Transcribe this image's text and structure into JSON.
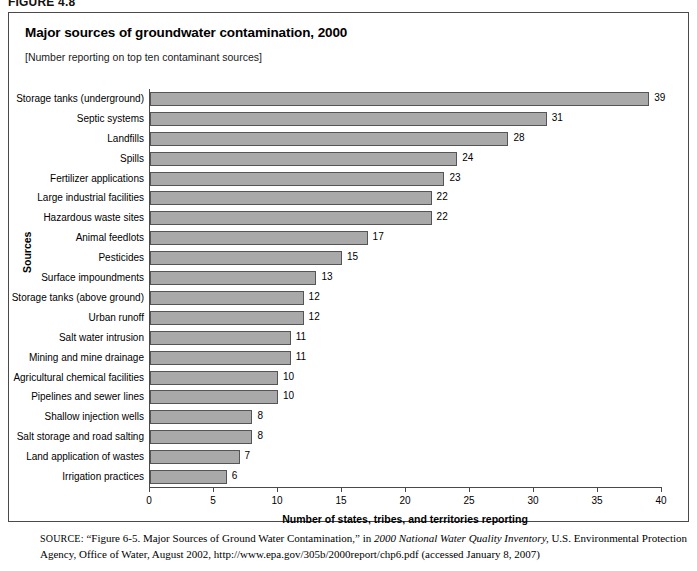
{
  "figure": {
    "number": "FIGURE 4.8"
  },
  "chart": {
    "title": "Major sources of groundwater contamination, 2000",
    "subtitle": "[Number reporting on top ten contaminant sources]"
  },
  "source": {
    "label": "SOURCE:",
    "part1": "“Figure 6-5. Major Sources of Ground Water Contamination,” in ",
    "italic1": "2000 National Water Quality Inventory,",
    "part2": " U.S. Environmental Protection Agency, Office of Water, August 2002, http://www.epa.gov/305b/2000report/chp6.pdf (accessed January 8, 2007)"
  },
  "chart_data": {
    "type": "bar",
    "orientation": "horizontal",
    "title": "Major sources of groundwater contamination, 2000",
    "subtitle": "[Number reporting on top ten contaminant sources]",
    "xlabel": "Number of states, tribes, and territories reporting",
    "ylabel": "Sources",
    "xlim": [
      0,
      40
    ],
    "xticks": [
      0,
      5,
      10,
      15,
      20,
      25,
      30,
      35,
      40
    ],
    "grid": false,
    "legend": false,
    "bar_color": "#a9a9a9",
    "bar_border_color": "#555555",
    "categories": [
      "Storage tanks (underground)",
      "Septic systems",
      "Landfills",
      "Spills",
      "Fertilizer applications",
      "Large industrial facilities",
      "Hazardous waste sites",
      "Animal feedlots",
      "Pesticides",
      "Surface impoundments",
      "Storage tanks (above ground)",
      "Urban runoff",
      "Salt water intrusion",
      "Mining and mine drainage",
      "Agricultural chemical facilities",
      "Pipelines and sewer lines",
      "Shallow injection wells",
      "Salt storage and road salting",
      "Land application of wastes",
      "Irrigation practices"
    ],
    "values": [
      39,
      31,
      28,
      24,
      23,
      22,
      22,
      17,
      15,
      13,
      12,
      12,
      11,
      11,
      10,
      10,
      8,
      8,
      7,
      6
    ]
  }
}
